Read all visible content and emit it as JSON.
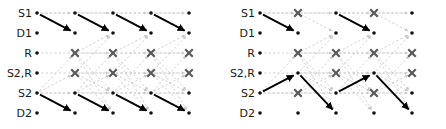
{
  "figure": {
    "type": "trellis-diagram-pair",
    "width": 446,
    "height": 129,
    "background": "#ffffff"
  },
  "style": {
    "dot_color": "#111111",
    "x_color": "#595959",
    "solid_path_color": "#000000",
    "faint_edge_color": "#c8c8c8",
    "grid_dash_color": "#c0c0c0",
    "label_color": "#1a1a1a",
    "dot_radius": 1.8,
    "x_size": 7.5
  },
  "panels": [
    {
      "id": "left",
      "name": "panel-left",
      "x_offset": 0,
      "row_labels": [
        "S1",
        "D1",
        "R",
        "S2,R",
        "S2",
        "D2"
      ],
      "row_y": [
        13,
        33,
        53,
        73,
        93,
        113
      ],
      "col_x": [
        37,
        75,
        113,
        151,
        189
      ],
      "label_x": 32,
      "nodes": [
        {
          "row": 0,
          "col": 0,
          "kind": "dot"
        },
        {
          "row": 0,
          "col": 1,
          "kind": "dot"
        },
        {
          "row": 0,
          "col": 2,
          "kind": "dot"
        },
        {
          "row": 0,
          "col": 3,
          "kind": "dot"
        },
        {
          "row": 0,
          "col": 4,
          "kind": "dot"
        },
        {
          "row": 1,
          "col": 0,
          "kind": "dot"
        },
        {
          "row": 1,
          "col": 1,
          "kind": "dot"
        },
        {
          "row": 1,
          "col": 2,
          "kind": "dot"
        },
        {
          "row": 1,
          "col": 3,
          "kind": "dot"
        },
        {
          "row": 1,
          "col": 4,
          "kind": "dot"
        },
        {
          "row": 2,
          "col": 0,
          "kind": "dot"
        },
        {
          "row": 2,
          "col": 1,
          "kind": "x"
        },
        {
          "row": 2,
          "col": 2,
          "kind": "x"
        },
        {
          "row": 2,
          "col": 3,
          "kind": "x"
        },
        {
          "row": 2,
          "col": 4,
          "kind": "x"
        },
        {
          "row": 3,
          "col": 0,
          "kind": "dot"
        },
        {
          "row": 3,
          "col": 1,
          "kind": "x"
        },
        {
          "row": 3,
          "col": 2,
          "kind": "x"
        },
        {
          "row": 3,
          "col": 3,
          "kind": "x"
        },
        {
          "row": 3,
          "col": 4,
          "kind": "x"
        },
        {
          "row": 4,
          "col": 0,
          "kind": "dot"
        },
        {
          "row": 4,
          "col": 1,
          "kind": "dot"
        },
        {
          "row": 4,
          "col": 2,
          "kind": "dot"
        },
        {
          "row": 4,
          "col": 3,
          "kind": "dot"
        },
        {
          "row": 4,
          "col": 4,
          "kind": "dot"
        },
        {
          "row": 5,
          "col": 0,
          "kind": "dot"
        },
        {
          "row": 5,
          "col": 1,
          "kind": "dot"
        },
        {
          "row": 5,
          "col": 2,
          "kind": "dot"
        },
        {
          "row": 5,
          "col": 3,
          "kind": "dot"
        },
        {
          "row": 5,
          "col": 4,
          "kind": "dot"
        }
      ],
      "grid_rows": [
        0,
        2,
        3,
        4
      ],
      "solid_edges": [
        {
          "from": [
            0,
            0
          ],
          "to": [
            1,
            1
          ]
        },
        {
          "from": [
            0,
            1
          ],
          "to": [
            1,
            2
          ]
        },
        {
          "from": [
            0,
            2
          ],
          "to": [
            1,
            3
          ]
        },
        {
          "from": [
            0,
            3
          ],
          "to": [
            1,
            4
          ]
        },
        {
          "from": [
            4,
            0
          ],
          "to": [
            5,
            1
          ]
        },
        {
          "from": [
            4,
            1
          ],
          "to": [
            5,
            2
          ]
        },
        {
          "from": [
            4,
            2
          ],
          "to": [
            5,
            3
          ]
        },
        {
          "from": [
            4,
            3
          ],
          "to": [
            5,
            4
          ]
        }
      ],
      "faint_edges": [
        {
          "from": [
            0,
            0
          ],
          "to": [
            0,
            1
          ]
        },
        {
          "from": [
            0,
            1
          ],
          "to": [
            0,
            2
          ]
        },
        {
          "from": [
            0,
            2
          ],
          "to": [
            0,
            3
          ]
        },
        {
          "from": [
            0,
            3
          ],
          "to": [
            0,
            4
          ]
        },
        {
          "from": [
            4,
            0
          ],
          "to": [
            4,
            1
          ]
        },
        {
          "from": [
            4,
            1
          ],
          "to": [
            4,
            2
          ]
        },
        {
          "from": [
            4,
            2
          ],
          "to": [
            4,
            3
          ]
        },
        {
          "from": [
            4,
            3
          ],
          "to": [
            4,
            4
          ]
        },
        {
          "from": [
            2,
            1
          ],
          "to": [
            2,
            2
          ]
        },
        {
          "from": [
            2,
            2
          ],
          "to": [
            2,
            3
          ]
        },
        {
          "from": [
            2,
            3
          ],
          "to": [
            2,
            4
          ]
        },
        {
          "from": [
            3,
            1
          ],
          "to": [
            3,
            2
          ]
        },
        {
          "from": [
            3,
            2
          ],
          "to": [
            3,
            3
          ]
        },
        {
          "from": [
            3,
            3
          ],
          "to": [
            3,
            4
          ]
        },
        {
          "from": [
            4,
            0
          ],
          "to": [
            2,
            1
          ]
        },
        {
          "from": [
            4,
            0
          ],
          "to": [
            3,
            1
          ]
        },
        {
          "from": [
            4,
            1
          ],
          "to": [
            2,
            2
          ]
        },
        {
          "from": [
            4,
            1
          ],
          "to": [
            3,
            2
          ]
        },
        {
          "from": [
            4,
            2
          ],
          "to": [
            2,
            3
          ]
        },
        {
          "from": [
            4,
            2
          ],
          "to": [
            3,
            3
          ]
        },
        {
          "from": [
            4,
            3
          ],
          "to": [
            2,
            4
          ]
        },
        {
          "from": [
            4,
            3
          ],
          "to": [
            3,
            4
          ]
        },
        {
          "from": [
            2,
            1
          ],
          "to": [
            1,
            2
          ]
        },
        {
          "from": [
            3,
            1
          ],
          "to": [
            1,
            2
          ]
        },
        {
          "from": [
            2,
            2
          ],
          "to": [
            1,
            3
          ]
        },
        {
          "from": [
            3,
            2
          ],
          "to": [
            1,
            3
          ]
        },
        {
          "from": [
            2,
            3
          ],
          "to": [
            1,
            4
          ]
        },
        {
          "from": [
            3,
            3
          ],
          "to": [
            1,
            4
          ]
        },
        {
          "from": [
            2,
            1
          ],
          "to": [
            5,
            2
          ]
        },
        {
          "from": [
            3,
            1
          ],
          "to": [
            5,
            2
          ]
        },
        {
          "from": [
            2,
            2
          ],
          "to": [
            5,
            3
          ]
        },
        {
          "from": [
            3,
            2
          ],
          "to": [
            5,
            3
          ]
        },
        {
          "from": [
            2,
            3
          ],
          "to": [
            5,
            4
          ]
        },
        {
          "from": [
            3,
            3
          ],
          "to": [
            5,
            4
          ]
        },
        {
          "from": [
            2,
            1
          ],
          "to": [
            4,
            2
          ]
        },
        {
          "from": [
            3,
            1
          ],
          "to": [
            4,
            2
          ]
        },
        {
          "from": [
            2,
            2
          ],
          "to": [
            4,
            3
          ]
        },
        {
          "from": [
            3,
            2
          ],
          "to": [
            4,
            3
          ]
        },
        {
          "from": [
            2,
            3
          ],
          "to": [
            4,
            4
          ]
        },
        {
          "from": [
            3,
            3
          ],
          "to": [
            4,
            4
          ]
        }
      ]
    },
    {
      "id": "right",
      "name": "panel-right",
      "x_offset": 223,
      "row_labels": [
        "S1",
        "D1",
        "R",
        "S2,R",
        "S2",
        "D2"
      ],
      "row_y": [
        13,
        33,
        53,
        73,
        93,
        113
      ],
      "col_x": [
        37,
        75,
        113,
        151,
        189
      ],
      "label_x": 32,
      "nodes": [
        {
          "row": 0,
          "col": 0,
          "kind": "dot"
        },
        {
          "row": 0,
          "col": 1,
          "kind": "x"
        },
        {
          "row": 0,
          "col": 2,
          "kind": "dot"
        },
        {
          "row": 0,
          "col": 3,
          "kind": "x"
        },
        {
          "row": 0,
          "col": 4,
          "kind": "dot"
        },
        {
          "row": 1,
          "col": 0,
          "kind": "dot"
        },
        {
          "row": 1,
          "col": 1,
          "kind": "dot"
        },
        {
          "row": 1,
          "col": 2,
          "kind": "dot"
        },
        {
          "row": 1,
          "col": 3,
          "kind": "dot"
        },
        {
          "row": 1,
          "col": 4,
          "kind": "dot"
        },
        {
          "row": 2,
          "col": 0,
          "kind": "dot"
        },
        {
          "row": 2,
          "col": 1,
          "kind": "x"
        },
        {
          "row": 2,
          "col": 2,
          "kind": "x"
        },
        {
          "row": 2,
          "col": 3,
          "kind": "x"
        },
        {
          "row": 2,
          "col": 4,
          "kind": "x"
        },
        {
          "row": 3,
          "col": 0,
          "kind": "dot"
        },
        {
          "row": 3,
          "col": 1,
          "kind": "dot"
        },
        {
          "row": 3,
          "col": 2,
          "kind": "x"
        },
        {
          "row": 3,
          "col": 3,
          "kind": "dot"
        },
        {
          "row": 3,
          "col": 4,
          "kind": "x"
        },
        {
          "row": 4,
          "col": 0,
          "kind": "dot"
        },
        {
          "row": 4,
          "col": 1,
          "kind": "x"
        },
        {
          "row": 4,
          "col": 2,
          "kind": "dot"
        },
        {
          "row": 4,
          "col": 3,
          "kind": "x"
        },
        {
          "row": 4,
          "col": 4,
          "kind": "dot"
        },
        {
          "row": 5,
          "col": 0,
          "kind": "dot"
        },
        {
          "row": 5,
          "col": 1,
          "kind": "dot"
        },
        {
          "row": 5,
          "col": 2,
          "kind": "dot"
        },
        {
          "row": 5,
          "col": 3,
          "kind": "dot"
        },
        {
          "row": 5,
          "col": 4,
          "kind": "dot"
        }
      ],
      "grid_rows": [
        0,
        2,
        3,
        4
      ],
      "solid_edges": [
        {
          "from": [
            0,
            0
          ],
          "to": [
            1,
            1
          ]
        },
        {
          "from": [
            0,
            2
          ],
          "to": [
            1,
            3
          ]
        },
        {
          "from": [
            4,
            0
          ],
          "to": [
            3,
            1
          ]
        },
        {
          "from": [
            3,
            1
          ],
          "to": [
            5,
            2
          ]
        },
        {
          "from": [
            4,
            2
          ],
          "to": [
            3,
            3
          ]
        },
        {
          "from": [
            3,
            3
          ],
          "to": [
            5,
            4
          ]
        }
      ],
      "faint_edges": [
        {
          "from": [
            0,
            0
          ],
          "to": [
            0,
            1
          ]
        },
        {
          "from": [
            0,
            1
          ],
          "to": [
            0,
            2
          ]
        },
        {
          "from": [
            0,
            2
          ],
          "to": [
            0,
            3
          ]
        },
        {
          "from": [
            0,
            3
          ],
          "to": [
            0,
            4
          ]
        },
        {
          "from": [
            4,
            0
          ],
          "to": [
            4,
            1
          ]
        },
        {
          "from": [
            4,
            1
          ],
          "to": [
            4,
            2
          ]
        },
        {
          "from": [
            4,
            2
          ],
          "to": [
            4,
            3
          ]
        },
        {
          "from": [
            4,
            3
          ],
          "to": [
            4,
            4
          ]
        },
        {
          "from": [
            2,
            1
          ],
          "to": [
            2,
            2
          ]
        },
        {
          "from": [
            2,
            2
          ],
          "to": [
            2,
            3
          ]
        },
        {
          "from": [
            2,
            3
          ],
          "to": [
            2,
            4
          ]
        },
        {
          "from": [
            3,
            1
          ],
          "to": [
            3,
            2
          ]
        },
        {
          "from": [
            3,
            2
          ],
          "to": [
            3,
            3
          ]
        },
        {
          "from": [
            3,
            3
          ],
          "to": [
            3,
            4
          ]
        },
        {
          "from": [
            4,
            0
          ],
          "to": [
            2,
            1
          ]
        },
        {
          "from": [
            4,
            1
          ],
          "to": [
            2,
            2
          ]
        },
        {
          "from": [
            4,
            1
          ],
          "to": [
            3,
            2
          ]
        },
        {
          "from": [
            4,
            2
          ],
          "to": [
            2,
            3
          ]
        },
        {
          "from": [
            4,
            3
          ],
          "to": [
            2,
            4
          ]
        },
        {
          "from": [
            4,
            3
          ],
          "to": [
            3,
            4
          ]
        },
        {
          "from": [
            2,
            1
          ],
          "to": [
            1,
            2
          ]
        },
        {
          "from": [
            3,
            1
          ],
          "to": [
            1,
            2
          ]
        },
        {
          "from": [
            2,
            2
          ],
          "to": [
            1,
            3
          ]
        },
        {
          "from": [
            3,
            2
          ],
          "to": [
            1,
            3
          ]
        },
        {
          "from": [
            2,
            3
          ],
          "to": [
            1,
            4
          ]
        },
        {
          "from": [
            3,
            3
          ],
          "to": [
            1,
            4
          ]
        },
        {
          "from": [
            2,
            1
          ],
          "to": [
            5,
            2
          ]
        },
        {
          "from": [
            2,
            2
          ],
          "to": [
            5,
            3
          ]
        },
        {
          "from": [
            3,
            2
          ],
          "to": [
            5,
            3
          ]
        },
        {
          "from": [
            2,
            3
          ],
          "to": [
            5,
            4
          ]
        },
        {
          "from": [
            2,
            1
          ],
          "to": [
            4,
            2
          ]
        },
        {
          "from": [
            3,
            1
          ],
          "to": [
            4,
            2
          ]
        },
        {
          "from": [
            2,
            2
          ],
          "to": [
            4,
            3
          ]
        },
        {
          "from": [
            3,
            2
          ],
          "to": [
            4,
            3
          ]
        },
        {
          "from": [
            2,
            3
          ],
          "to": [
            4,
            4
          ]
        },
        {
          "from": [
            3,
            3
          ],
          "to": [
            4,
            4
          ]
        },
        {
          "from": [
            0,
            1
          ],
          "to": [
            1,
            2
          ]
        },
        {
          "from": [
            0,
            3
          ],
          "to": [
            1,
            4
          ]
        }
      ]
    }
  ]
}
